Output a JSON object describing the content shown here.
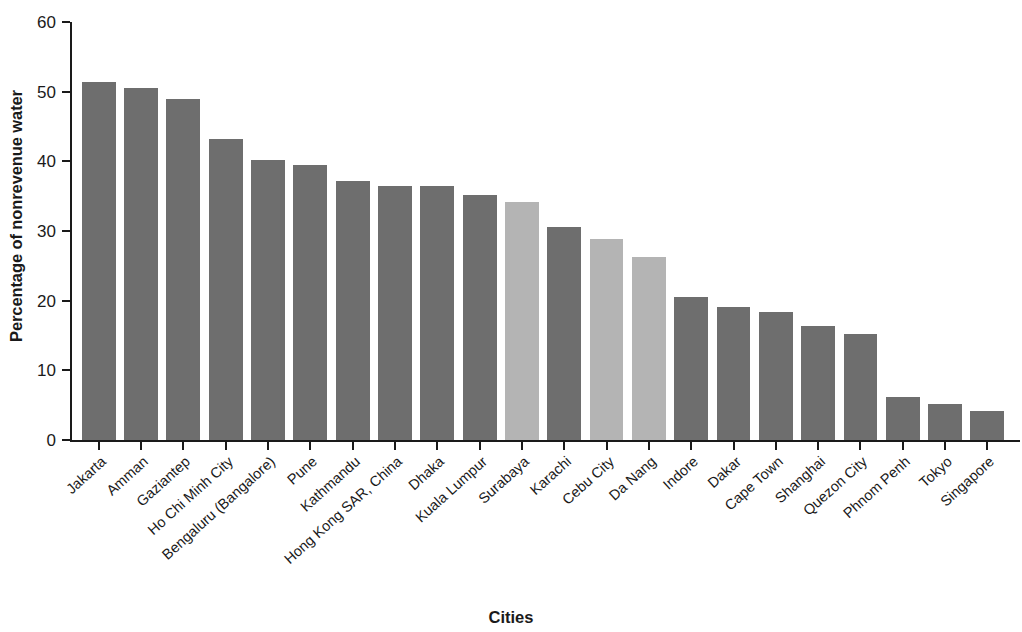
{
  "chart_data": {
    "type": "bar",
    "title": "",
    "xlabel": "Cities",
    "ylabel": "Percentage of nonrevenue water",
    "ylim": [
      0,
      60
    ],
    "yticks": [
      0,
      10,
      20,
      30,
      40,
      50,
      60
    ],
    "grid": false,
    "legend": null,
    "categories": [
      "Jakarta",
      "Amman",
      "Gaziantep",
      "Ho Chi Minh City",
      "Bengaluru (Bangalore)",
      "Pune",
      "Kathmandu",
      "Hong Kong SAR, China",
      "Dhaka",
      "Kuala Lumpur",
      "Surabaya",
      "Karachi",
      "Cebu City",
      "Da Nang",
      "Indore",
      "Dakar",
      "Cape Town",
      "Shanghai",
      "Quezon City",
      "Phnom Penh",
      "Tokyo",
      "Singapore"
    ],
    "values": [
      51.4,
      50.5,
      48.9,
      43.2,
      40.2,
      39.5,
      37.2,
      36.4,
      36.4,
      35.2,
      34.1,
      30.6,
      28.9,
      26.3,
      20.5,
      19.1,
      18.4,
      16.3,
      15.2,
      6.2,
      5.1,
      4.2
    ],
    "bar_shades": [
      "dark",
      "dark",
      "dark",
      "dark",
      "dark",
      "dark",
      "dark",
      "dark",
      "dark",
      "dark",
      "light",
      "dark",
      "light",
      "light",
      "dark",
      "dark",
      "dark",
      "dark",
      "dark",
      "dark",
      "dark",
      "dark"
    ],
    "colors": {
      "dark": "#6e6e6e",
      "light": "#b4b4b4",
      "axis": "#1a1a1a",
      "background": "#ffffff"
    }
  }
}
